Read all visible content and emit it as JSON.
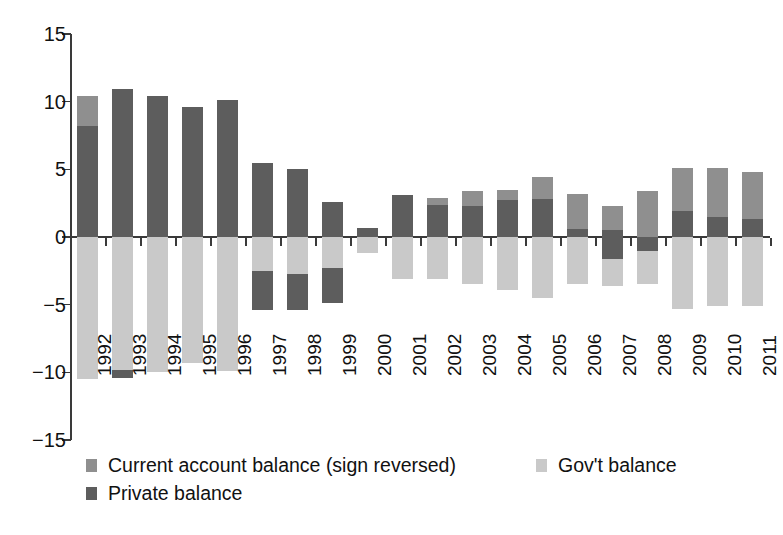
{
  "chart_data": {
    "type": "bar",
    "subtype": "stacked-diverging",
    "title": "",
    "xlabel": "",
    "ylabel": "",
    "ylim": [
      -15,
      15
    ],
    "yticks": [
      15,
      10,
      5,
      0,
      -5,
      -10,
      -15
    ],
    "ytick_labels": [
      "15",
      "10",
      "5",
      "0",
      "−5",
      "−10",
      "−15"
    ],
    "grid": false,
    "legend_position": "bottom",
    "categories": [
      "1992",
      "1993",
      "1994",
      "1995",
      "1996",
      "1997",
      "1998",
      "1999",
      "2000",
      "2001",
      "2002",
      "2003",
      "2004",
      "2005",
      "2006",
      "2007",
      "2008",
      "2009",
      "2010",
      "2011"
    ],
    "series": [
      {
        "name": "Current account balance (sign reversed)",
        "color": "#8f8f8f",
        "values": [
          10.4,
          10.9,
          10.4,
          9.6,
          10.1,
          5.5,
          5.0,
          2.6,
          0.7,
          3.1,
          2.9,
          3.4,
          3.5,
          4.4,
          3.2,
          2.3,
          3.4,
          5.1,
          5.1,
          4.8
        ]
      },
      {
        "name": "Private balance",
        "color": "#5d5d5d",
        "values": [
          8.2,
          10.9,
          10.4,
          9.6,
          10.1,
          5.5,
          5.0,
          2.6,
          0.7,
          3.1,
          2.4,
          2.3,
          2.7,
          2.8,
          0.6,
          0.5,
          -1.0,
          1.9,
          1.5,
          1.3
        ]
      },
      {
        "name": "Gov't balance",
        "color": "#c9c9c9",
        "values": [
          -10.5,
          -10.4,
          -10.0,
          -9.3,
          -9.9,
          -2.5,
          -2.7,
          -2.3,
          -1.2,
          -3.1,
          -3.1,
          -3.5,
          -3.9,
          -4.5,
          -3.5,
          -3.6,
          -3.5,
          -5.3,
          -5.1,
          -5.1
        ]
      }
    ],
    "bar_segments": [
      {
        "year": "1992",
        "current_top": 10.4,
        "private_top": 8.2,
        "private_bottom": 0.0,
        "govt_top": 0.0,
        "govt_bottom": -10.5,
        "private_neg_top": null,
        "private_neg_bottom": null
      },
      {
        "year": "1993",
        "current_top": 10.9,
        "private_top": 10.9,
        "private_bottom": 0.0,
        "govt_top": 0.0,
        "govt_bottom": -10.4,
        "private_neg_top": -9.8,
        "private_neg_bottom": -10.4
      },
      {
        "year": "1994",
        "current_top": 10.4,
        "private_top": 10.4,
        "private_bottom": 0.0,
        "govt_top": 0.0,
        "govt_bottom": -10.0,
        "private_neg_top": null,
        "private_neg_bottom": null
      },
      {
        "year": "1995",
        "current_top": 9.6,
        "private_top": 9.6,
        "private_bottom": 0.0,
        "govt_top": 0.0,
        "govt_bottom": -9.3,
        "private_neg_top": null,
        "private_neg_bottom": null
      },
      {
        "year": "1996",
        "current_top": 10.1,
        "private_top": 10.1,
        "private_bottom": 0.0,
        "govt_top": 0.0,
        "govt_bottom": -9.9,
        "private_neg_top": null,
        "private_neg_bottom": null
      },
      {
        "year": "1997",
        "current_top": 5.5,
        "private_top": 5.5,
        "private_bottom": 0.0,
        "govt_top": 0.0,
        "govt_bottom": -2.5,
        "private_neg_top": -2.5,
        "private_neg_bottom": -5.4
      },
      {
        "year": "1998",
        "current_top": 5.0,
        "private_top": 5.0,
        "private_bottom": 0.0,
        "govt_top": 0.0,
        "govt_bottom": -2.7,
        "private_neg_top": -2.7,
        "private_neg_bottom": -5.4
      },
      {
        "year": "1999",
        "current_top": 2.6,
        "private_top": 2.6,
        "private_bottom": 0.0,
        "govt_top": 0.0,
        "govt_bottom": -2.3,
        "private_neg_top": -2.3,
        "private_neg_bottom": -4.9
      },
      {
        "year": "2000",
        "current_top": 0.7,
        "private_top": 0.7,
        "private_bottom": 0.0,
        "govt_top": 0.0,
        "govt_bottom": -1.2,
        "private_neg_top": null,
        "private_neg_bottom": null
      },
      {
        "year": "2001",
        "current_top": 3.1,
        "private_top": 3.1,
        "private_bottom": 0.0,
        "govt_top": 0.0,
        "govt_bottom": -3.1,
        "private_neg_top": null,
        "private_neg_bottom": null
      },
      {
        "year": "2002",
        "current_top": 2.9,
        "private_top": 2.4,
        "private_bottom": 0.0,
        "govt_top": 0.0,
        "govt_bottom": -3.1,
        "private_neg_top": null,
        "private_neg_bottom": null
      },
      {
        "year": "2003",
        "current_top": 3.4,
        "private_top": 2.3,
        "private_bottom": 0.0,
        "govt_top": 0.0,
        "govt_bottom": -3.5,
        "private_neg_top": null,
        "private_neg_bottom": null
      },
      {
        "year": "2004",
        "current_top": 3.5,
        "private_top": 2.7,
        "private_bottom": 0.0,
        "govt_top": 0.0,
        "govt_bottom": -3.9,
        "private_neg_top": null,
        "private_neg_bottom": null
      },
      {
        "year": "2005",
        "current_top": 4.4,
        "private_top": 2.8,
        "private_bottom": 0.0,
        "govt_top": 0.0,
        "govt_bottom": -4.5,
        "private_neg_top": null,
        "private_neg_bottom": null
      },
      {
        "year": "2006",
        "current_top": 3.2,
        "private_top": 0.6,
        "private_bottom": 0.0,
        "govt_top": 0.0,
        "govt_bottom": -3.5,
        "private_neg_top": null,
        "private_neg_bottom": null
      },
      {
        "year": "2007",
        "current_top": 2.3,
        "private_top": 0.5,
        "private_bottom": -1.6,
        "govt_top": -1.6,
        "govt_bottom": -3.6,
        "private_neg_top": null,
        "private_neg_bottom": null
      },
      {
        "year": "2008",
        "current_top": 3.4,
        "private_top": 0.0,
        "private_bottom": -1.0,
        "govt_top": -1.0,
        "govt_bottom": -3.5,
        "private_neg_top": null,
        "private_neg_bottom": null
      },
      {
        "year": "2009",
        "current_top": 5.1,
        "private_top": 1.9,
        "private_bottom": 0.0,
        "govt_top": 0.0,
        "govt_bottom": -5.3,
        "private_neg_top": null,
        "private_neg_bottom": null
      },
      {
        "year": "2010",
        "current_top": 5.1,
        "private_top": 1.5,
        "private_bottom": 0.0,
        "govt_top": 0.0,
        "govt_bottom": -5.1,
        "private_neg_top": null,
        "private_neg_bottom": null
      },
      {
        "year": "2011",
        "current_top": 4.8,
        "private_top": 1.3,
        "private_bottom": 0.0,
        "govt_top": 0.0,
        "govt_bottom": -5.1,
        "private_neg_top": null,
        "private_neg_bottom": null
      }
    ],
    "legend": [
      {
        "label": "Current account balance (sign reversed)",
        "color": "#8f8f8f",
        "column": 0,
        "row": 0
      },
      {
        "label": "Gov't balance",
        "color": "#c9c9c9",
        "column": 1,
        "row": 0
      },
      {
        "label": "Private balance",
        "color": "#5d5d5d",
        "column": 0,
        "row": 1
      }
    ]
  },
  "axis": {
    "zero_label": "0"
  }
}
